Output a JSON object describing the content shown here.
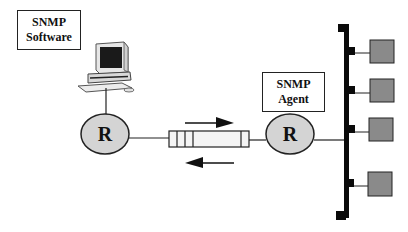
{
  "diagram": {
    "title": "",
    "manager_label": {
      "line1": "SNMP",
      "line2": "Software"
    },
    "agent_label": {
      "line1": "SNMP",
      "line2": "Agent"
    },
    "routers": [
      {
        "id": "router-left",
        "label": "R"
      },
      {
        "id": "router-right",
        "label": "R"
      }
    ],
    "link": {
      "type": "message-queue",
      "arrows": [
        "request-right",
        "response-left"
      ]
    },
    "bus": {
      "devices": 4
    },
    "colors": {
      "router_fill": "#d4d4d4",
      "device_fill": "#8a8a8a",
      "bus": "#0a0a0a",
      "stroke": "#222222"
    }
  }
}
